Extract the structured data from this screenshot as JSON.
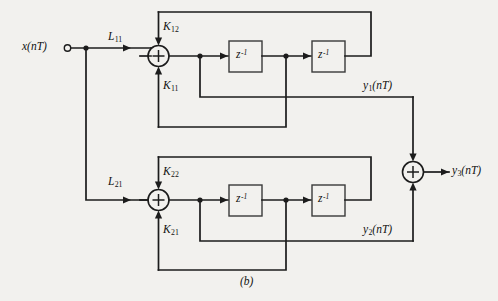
{
  "figure": {
    "caption": "(b)",
    "type": "signal-flow-graph"
  },
  "signals": {
    "input": {
      "name": "x",
      "arg": "(nT)",
      "label_full": "x(nT)"
    },
    "y1": {
      "name": "y",
      "index": "1",
      "arg": "(nT)"
    },
    "y2": {
      "name": "y",
      "index": "2",
      "arg": "(nT)"
    },
    "y3": {
      "name": "y",
      "index": "3",
      "arg": "(nT)"
    }
  },
  "coefficients": {
    "L11": {
      "name": "L",
      "index": "11"
    },
    "L21": {
      "name": "L",
      "index": "21"
    },
    "K12": {
      "name": "K",
      "index": "12"
    },
    "K11": {
      "name": "K",
      "index": "11"
    },
    "K22": {
      "name": "K",
      "index": "22"
    },
    "K21": {
      "name": "K",
      "index": "21"
    }
  },
  "delay_blocks": [
    {
      "id": "delay-top-1",
      "label": "z",
      "exponent": "-1"
    },
    {
      "id": "delay-top-2",
      "label": "z",
      "exponent": "-1"
    },
    {
      "id": "delay-bottom-1",
      "label": "z",
      "exponent": "-1"
    },
    {
      "id": "delay-bottom-2",
      "label": "z",
      "exponent": "-1"
    }
  ],
  "summers": [
    {
      "id": "summer-top",
      "symbol": "+"
    },
    {
      "id": "summer-bottom",
      "symbol": "+"
    },
    {
      "id": "summer-output",
      "symbol": "+"
    }
  ],
  "colors": {
    "background": "#f2f1ee",
    "wire": "#1c1c1c",
    "box_stroke": "#3a3a3a",
    "text": "#111111"
  }
}
